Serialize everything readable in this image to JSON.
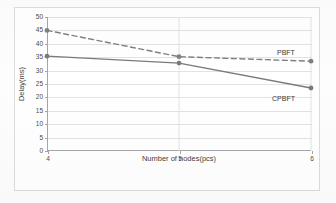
{
  "chart_data": {
    "type": "line",
    "title": "",
    "xlabel": "Number of nodes(pcs)",
    "ylabel": "Delay(ms)",
    "x": [
      4,
      5,
      6
    ],
    "xtick_labels": [
      "4",
      "5",
      "6"
    ],
    "xlim": [
      4,
      6
    ],
    "ylim": [
      0,
      50
    ],
    "ytick_labels": [
      "0",
      "5",
      "10",
      "15",
      "20",
      "25",
      "30",
      "35",
      "40",
      "45",
      "50"
    ],
    "yticks": [
      0,
      5,
      10,
      15,
      20,
      25,
      30,
      35,
      40,
      45,
      50
    ],
    "grid": "horizontal",
    "legend_position": "inline-right",
    "series": [
      {
        "name": "PBFT",
        "values": [
          45.0,
          35.2,
          33.5
        ],
        "style": "dashed",
        "color": "#808080",
        "marker": "circle"
      },
      {
        "name": "CPBFT",
        "values": [
          35.4,
          32.8,
          23.5
        ],
        "style": "solid",
        "color": "#7a7a7a",
        "marker": "circle"
      }
    ],
    "annotations": [
      {
        "text": "PBFT",
        "series": "PBFT"
      },
      {
        "text": "CPBFT",
        "series": "CPBFT"
      }
    ]
  },
  "colors": {
    "axis": "#a6a6a6",
    "grid": "#e2e2e2",
    "text": "#4a4a4a",
    "series_pbft": "#808080",
    "series_cpbft": "#7a7a7a",
    "frame": "#dcdcdc"
  }
}
